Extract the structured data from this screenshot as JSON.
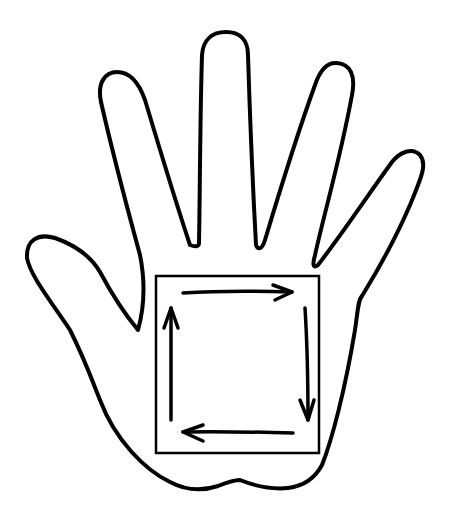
{
  "diagram": {
    "title": "Hand outline with clockwise square arrows on palm",
    "colors": {
      "stroke": "#000000",
      "background": "#ffffff"
    },
    "elements": {
      "hand": {
        "label": "hand-outline"
      },
      "square": {
        "label": "palm-square",
        "x": 155,
        "y": 275,
        "width": 165,
        "height": 178
      },
      "arrows": [
        {
          "label": "arrow-right",
          "direction": "right",
          "from": [
            182,
            293
          ],
          "to": [
            293,
            292
          ]
        },
        {
          "label": "arrow-down",
          "direction": "down",
          "from": [
            306,
            307
          ],
          "to": [
            308,
            420
          ]
        },
        {
          "label": "arrow-left",
          "direction": "left",
          "from": [
            293,
            433
          ],
          "to": [
            182,
            431
          ]
        },
        {
          "label": "arrow-up",
          "direction": "up",
          "from": [
            171,
            420
          ],
          "to": [
            171,
            307
          ]
        }
      ]
    }
  }
}
